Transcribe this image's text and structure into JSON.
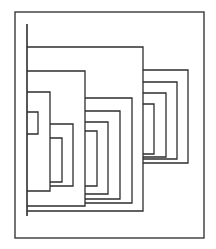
{
  "diagram": {
    "type": "nested-bracket-dendrogram",
    "width": 216,
    "height": 249,
    "colors": {
      "background": "#ffffff",
      "line": "#2e2e2e",
      "frame": "#3a3a3a"
    },
    "frame": {
      "x": 15,
      "y": 12,
      "w": 189,
      "h": 226
    },
    "root_line": {
      "x": 27,
      "y1": 24,
      "y2": 216
    },
    "brackets": [
      {
        "name": "level1-top",
        "x1": 27,
        "x2": 143,
        "y1": 47,
        "y2": 211
      },
      {
        "name": "level2-left",
        "x1": 27,
        "x2": 85,
        "y1": 71,
        "y2": 206
      },
      {
        "name": "level3-left",
        "x1": 27,
        "x2": 50,
        "y1": 92,
        "y2": 191
      },
      {
        "name": "level4-small",
        "x1": 27,
        "x2": 38,
        "y1": 112,
        "y2": 134
      },
      {
        "name": "level4-inner-a",
        "x1": 50,
        "x2": 73,
        "y1": 124,
        "y2": 186
      },
      {
        "name": "level5-inner-b",
        "x1": 50,
        "x2": 62,
        "y1": 138,
        "y2": 182
      },
      {
        "name": "mid-1",
        "x1": 85,
        "x2": 132,
        "y1": 98,
        "y2": 203
      },
      {
        "name": "mid-2",
        "x1": 85,
        "x2": 120,
        "y1": 111,
        "y2": 199
      },
      {
        "name": "mid-3",
        "x1": 85,
        "x2": 108,
        "y1": 122,
        "y2": 194
      },
      {
        "name": "mid-4",
        "x1": 85,
        "x2": 97,
        "y1": 131,
        "y2": 186
      },
      {
        "name": "right-1",
        "x1": 143,
        "x2": 188,
        "y1": 70,
        "y2": 163
      },
      {
        "name": "right-2",
        "x1": 143,
        "x2": 177,
        "y1": 82,
        "y2": 159
      },
      {
        "name": "right-3",
        "x1": 143,
        "x2": 166,
        "y1": 93,
        "y2": 157
      },
      {
        "name": "right-4",
        "x1": 143,
        "x2": 154,
        "y1": 104,
        "y2": 154
      }
    ]
  }
}
